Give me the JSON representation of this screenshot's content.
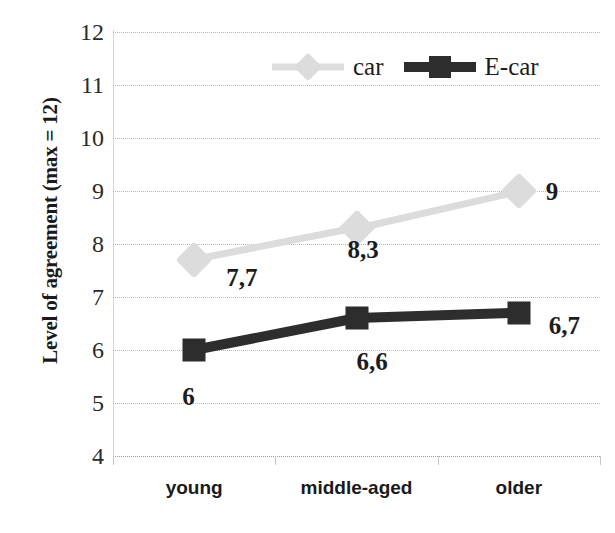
{
  "chart_data": {
    "type": "line",
    "title": "",
    "xlabel": "",
    "ylabel": "Level of agreement (max = 12)",
    "categories": [
      "young",
      "middle-aged",
      "older"
    ],
    "ylim": [
      4,
      12
    ],
    "ytick_labels": [
      "12",
      "11",
      "10",
      "9",
      "8",
      "7",
      "6",
      "5",
      "4"
    ],
    "yticks": [
      12,
      11,
      10,
      9,
      8,
      7,
      6,
      5,
      4
    ],
    "grid": "horizontal-dotted",
    "legend_position": "top-center",
    "series": [
      {
        "name": "car",
        "color": "#dcdcdc",
        "marker": "diamond",
        "values": [
          7.7,
          8.3,
          9.0
        ],
        "data_labels": [
          "7,7",
          "8,3",
          "9"
        ]
      },
      {
        "name": "E-car",
        "color": "#2d2d2d",
        "marker": "square",
        "values": [
          6.0,
          6.6,
          6.7
        ],
        "data_labels": [
          "6",
          "6,6",
          "6,7"
        ]
      }
    ]
  },
  "legend": {
    "items": [
      {
        "label": "car",
        "swatch": "car"
      },
      {
        "label": "E-car",
        "swatch": "ecar"
      }
    ]
  },
  "axis": {
    "y_title": "Level of agreement (max = 12)"
  }
}
